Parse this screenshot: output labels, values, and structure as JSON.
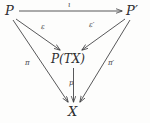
{
  "figure": {
    "kind": "commutative-diagram",
    "background_color": "#fdfdfc",
    "ink_color": "#2e2e30"
  },
  "nodes": {
    "source": "P",
    "source_prime": "P′",
    "middle": "P(TX)",
    "target": "X"
  },
  "arrows": {
    "iota": "ι",
    "epsilon": "ε",
    "epsilon_prime": "ε′",
    "pi": "π",
    "pi_prime": "π′",
    "p": "p"
  }
}
